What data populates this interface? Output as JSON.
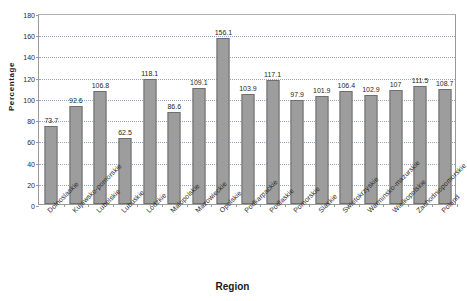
{
  "chart_data": {
    "type": "bar",
    "title": "",
    "xlabel": "Region",
    "ylabel": "Percentage",
    "ylim": [
      0,
      180
    ],
    "ytick_step": 20,
    "yticks": [
      0,
      20,
      40,
      60,
      80,
      100,
      120,
      140,
      160,
      180
    ],
    "grid": true,
    "legend": "none",
    "bar_color": "#9d9d9d",
    "bar_border_color": "#6f6f6f",
    "gridline_color": "#8fa8c8",
    "axis_color": "#9a9a9a",
    "categories": [
      "Dolnoslaskie",
      "Kujawsko-pomorskie",
      "Lubelskie",
      "Lubuskie",
      "Lódzkie",
      "Malopolskie",
      "Mazowieckie",
      "Opolskie",
      "Podkarpackie",
      "Podlaskie",
      "Pomorskie",
      "Slaskie",
      "Swietokrzyskie",
      "Warminsko-mazurskie",
      "Wielkopolskie",
      "Zachodniopomorskie",
      "Poland"
    ],
    "values": [
      73.7,
      92.6,
      106.8,
      62.5,
      118.1,
      86.6,
      109.1,
      156.1,
      103.9,
      117.1,
      97.9,
      101.9,
      106.4,
      102.9,
      107,
      111.5,
      108.7
    ],
    "value_labels": [
      "73.7",
      "92.6",
      "106.8",
      "62.5",
      "118.1",
      "86.6",
      "109.1",
      "156.1",
      "103.9",
      "117.1",
      "97.9",
      "101.9",
      "106.4",
      "102.9",
      "107",
      "111.5",
      "108.7"
    ]
  }
}
